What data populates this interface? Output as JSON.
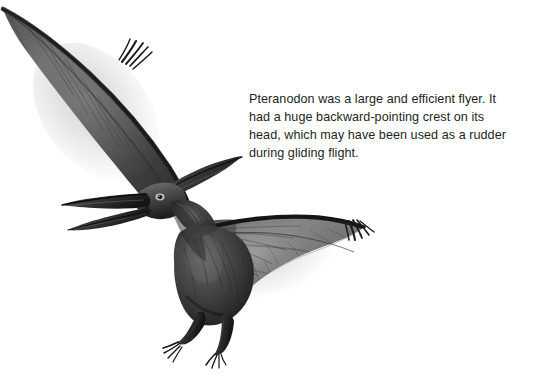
{
  "page": {
    "background_color": "#ffffff",
    "width": 534,
    "height": 377
  },
  "caption": {
    "text": "Pteranodon was a large and efficient flyer. It\nhad a huge backward-pointing crest on its\nhead, which may have been used as a rudder\nduring gliding flight.",
    "lines": [
      "Pteranodon was a large and efficient flyer. It",
      "had a huge backward-pointing crest on its",
      "head, which may have been used as a rudder",
      "during gliding flight."
    ],
    "color": "#231f20"
  },
  "illustration": {
    "subject": "Pteranodon",
    "style": "grayscale pencil and airbrush rendering",
    "description": "A Pteranodon in gliding flight, seen from the front-left. Its long left wing sweeps up to the top-left corner of the frame and its right wing extends to the right, both ending in small clawed fingers. The head carries a long pointed beak and a large backward-pointing crest. The body hangs below with two clawed legs.",
    "parts": [
      "left-wing",
      "right-wing",
      "head-with-crest",
      "beak",
      "body",
      "legs",
      "wing-claws"
    ],
    "colors": {
      "darkest": "#1a1a1a",
      "dark": "#3a3a3a",
      "mid": "#6d6d6d",
      "light": "#a9a9a9",
      "lightest": "#d8d8d8",
      "background": "#ffffff"
    }
  }
}
